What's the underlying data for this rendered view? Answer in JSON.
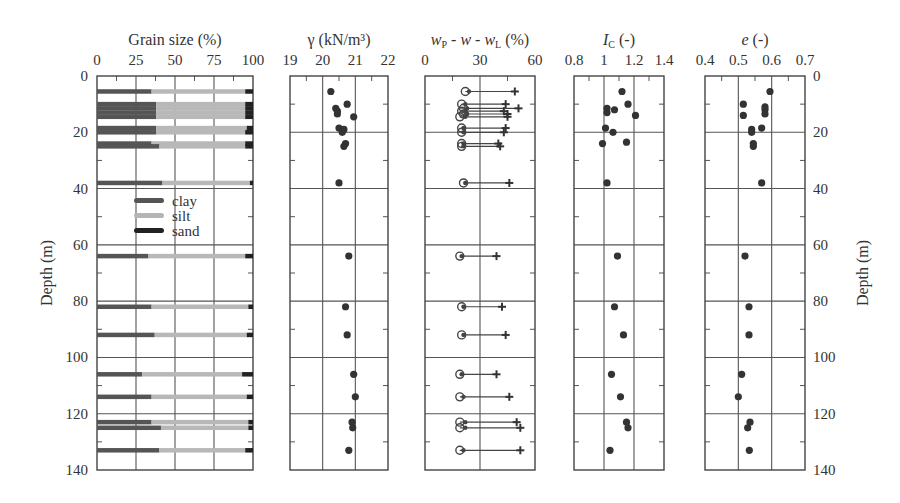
{
  "chart_data": [
    {
      "type": "bar",
      "id": "grain",
      "title": "Grain size (%)",
      "xlim": [
        0,
        100
      ],
      "xticks": [
        0,
        25,
        50,
        75,
        100
      ],
      "ylabel": "Depth (m)",
      "ylim": [
        0,
        140
      ],
      "yticks": [
        0,
        20,
        40,
        60,
        80,
        100,
        120,
        140
      ],
      "legend": [
        {
          "label": "clay",
          "color": "#555555"
        },
        {
          "label": "silt",
          "color": "#b5b5b5"
        },
        {
          "label": "sand",
          "color": "#222222"
        }
      ],
      "stacked_rows": [
        {
          "depth": 5.5,
          "clay": 35,
          "silt": 60,
          "sand": 5
        },
        {
          "depth": 10,
          "clay": 38,
          "silt": 57,
          "sand": 5
        },
        {
          "depth": 11.5,
          "clay": 38,
          "silt": 57,
          "sand": 5
        },
        {
          "depth": 13,
          "clay": 38,
          "silt": 57,
          "sand": 5
        },
        {
          "depth": 14.5,
          "clay": 38,
          "silt": 57,
          "sand": 5
        },
        {
          "depth": 18.5,
          "clay": 38,
          "silt": 58,
          "sand": 4
        },
        {
          "depth": 20,
          "clay": 38,
          "silt": 57,
          "sand": 5
        },
        {
          "depth": 24,
          "clay": 35,
          "silt": 60,
          "sand": 5
        },
        {
          "depth": 25,
          "clay": 40,
          "silt": 55,
          "sand": 5
        },
        {
          "depth": 38,
          "clay": 42,
          "silt": 56,
          "sand": 2
        },
        {
          "depth": 64,
          "clay": 33,
          "silt": 62,
          "sand": 5
        },
        {
          "depth": 82,
          "clay": 35,
          "silt": 62,
          "sand": 3
        },
        {
          "depth": 92,
          "clay": 37,
          "silt": 59,
          "sand": 4
        },
        {
          "depth": 106,
          "clay": 29,
          "silt": 64,
          "sand": 7
        },
        {
          "depth": 114,
          "clay": 35,
          "silt": 61,
          "sand": 4
        },
        {
          "depth": 123,
          "clay": 35,
          "silt": 62,
          "sand": 3
        },
        {
          "depth": 125,
          "clay": 41,
          "silt": 56,
          "sand": 3
        },
        {
          "depth": 133,
          "clay": 40,
          "silt": 55,
          "sand": 5
        }
      ]
    },
    {
      "type": "scatter",
      "id": "gamma",
      "title": "γ (kN/m³)",
      "xlim": [
        19,
        22
      ],
      "xticks": [
        19,
        20,
        21,
        22
      ],
      "ylim": [
        0,
        140
      ],
      "points": [
        {
          "x": 20.25,
          "depth": 5.5
        },
        {
          "x": 20.75,
          "depth": 10
        },
        {
          "x": 20.4,
          "depth": 11.5
        },
        {
          "x": 20.45,
          "depth": 12.5
        },
        {
          "x": 20.45,
          "depth": 13.5
        },
        {
          "x": 20.95,
          "depth": 14.5
        },
        {
          "x": 20.5,
          "depth": 18.5
        },
        {
          "x": 20.65,
          "depth": 19
        },
        {
          "x": 20.6,
          "depth": 20
        },
        {
          "x": 20.7,
          "depth": 24
        },
        {
          "x": 20.65,
          "depth": 25
        },
        {
          "x": 20.5,
          "depth": 38
        },
        {
          "x": 20.8,
          "depth": 64
        },
        {
          "x": 20.7,
          "depth": 82
        },
        {
          "x": 20.75,
          "depth": 92
        },
        {
          "x": 20.95,
          "depth": 106
        },
        {
          "x": 21.0,
          "depth": 114
        },
        {
          "x": 20.9,
          "depth": 123
        },
        {
          "x": 20.92,
          "depth": 125
        },
        {
          "x": 20.8,
          "depth": 133
        }
      ]
    },
    {
      "type": "range",
      "id": "atterberg",
      "title": "wP - w - wL (%)",
      "xlim": [
        0,
        60
      ],
      "xticks": [
        0,
        30,
        60
      ],
      "ylim": [
        0,
        140
      ],
      "rows": [
        {
          "depth": 5.5,
          "wP": 22,
          "w": 24,
          "wL": 49
        },
        {
          "depth": 10,
          "wP": 20,
          "w": 22,
          "wL": 44
        },
        {
          "depth": 11.5,
          "wP": 21,
          "w": 23,
          "wL": 51
        },
        {
          "depth": 12.5,
          "wP": 20,
          "w": 22,
          "wL": 43
        },
        {
          "depth": 13.5,
          "wP": 21,
          "w": 23,
          "wL": 45
        },
        {
          "depth": 14.5,
          "wP": 19,
          "w": 22,
          "wL": 45
        },
        {
          "depth": 18.5,
          "wP": 20,
          "w": 21,
          "wL": 44
        },
        {
          "depth": 20,
          "wP": 20,
          "w": 21,
          "wL": 43
        },
        {
          "depth": 24,
          "wP": 20,
          "w": 21,
          "wL": 40
        },
        {
          "depth": 25,
          "wP": 20,
          "w": 21,
          "wL": 41
        },
        {
          "depth": 38,
          "wP": 21,
          "w": 22,
          "wL": 46
        },
        {
          "depth": 64,
          "wP": 19,
          "w": 20,
          "wL": 39
        },
        {
          "depth": 82,
          "wP": 20,
          "w": 21,
          "wL": 42
        },
        {
          "depth": 92,
          "wP": 20,
          "w": 21,
          "wL": 44
        },
        {
          "depth": 106,
          "wP": 19,
          "w": 20,
          "wL": 39
        },
        {
          "depth": 114,
          "wP": 19,
          "w": 21,
          "wL": 46
        },
        {
          "depth": 123,
          "wP": 19,
          "w": 22,
          "wL": 50
        },
        {
          "depth": 125,
          "wP": 19,
          "w": 22,
          "wL": 52
        },
        {
          "depth": 133,
          "wP": 19,
          "w": 21,
          "wL": 52
        }
      ]
    },
    {
      "type": "scatter",
      "id": "ic",
      "title": "IC (-)",
      "xlim": [
        0.8,
        1.4
      ],
      "xticks": [
        0.8,
        1.0,
        1.2,
        1.4
      ],
      "ylim": [
        0,
        140
      ],
      "points": [
        {
          "x": 1.12,
          "depth": 5.5
        },
        {
          "x": 1.16,
          "depth": 10
        },
        {
          "x": 1.02,
          "depth": 11.5
        },
        {
          "x": 1.07,
          "depth": 12
        },
        {
          "x": 1.02,
          "depth": 13
        },
        {
          "x": 1.21,
          "depth": 14
        },
        {
          "x": 1.01,
          "depth": 18.5
        },
        {
          "x": 1.06,
          "depth": 20
        },
        {
          "x": 0.99,
          "depth": 24
        },
        {
          "x": 1.15,
          "depth": 23.5
        },
        {
          "x": 1.02,
          "depth": 38
        },
        {
          "x": 1.09,
          "depth": 64
        },
        {
          "x": 1.07,
          "depth": 82
        },
        {
          "x": 1.13,
          "depth": 92
        },
        {
          "x": 1.05,
          "depth": 106
        },
        {
          "x": 1.11,
          "depth": 114
        },
        {
          "x": 1.15,
          "depth": 123
        },
        {
          "x": 1.16,
          "depth": 125
        },
        {
          "x": 1.04,
          "depth": 133
        }
      ]
    },
    {
      "type": "scatter",
      "id": "e",
      "title": "e (-)",
      "xlim": [
        0.4,
        0.7
      ],
      "xticks": [
        0.4,
        0.5,
        0.6,
        0.7
      ],
      "ylabel": "Depth (m)",
      "ylim": [
        0,
        140
      ],
      "points": [
        {
          "x": 0.595,
          "depth": 5.5
        },
        {
          "x": 0.515,
          "depth": 10
        },
        {
          "x": 0.58,
          "depth": 11
        },
        {
          "x": 0.58,
          "depth": 12
        },
        {
          "x": 0.515,
          "depth": 14
        },
        {
          "x": 0.58,
          "depth": 13.5
        },
        {
          "x": 0.57,
          "depth": 18.5
        },
        {
          "x": 0.54,
          "depth": 19
        },
        {
          "x": 0.54,
          "depth": 20
        },
        {
          "x": 0.545,
          "depth": 24
        },
        {
          "x": 0.545,
          "depth": 25
        },
        {
          "x": 0.57,
          "depth": 38
        },
        {
          "x": 0.52,
          "depth": 64
        },
        {
          "x": 0.532,
          "depth": 82
        },
        {
          "x": 0.532,
          "depth": 92
        },
        {
          "x": 0.51,
          "depth": 106
        },
        {
          "x": 0.5,
          "depth": 114
        },
        {
          "x": 0.535,
          "depth": 123
        },
        {
          "x": 0.528,
          "depth": 125
        },
        {
          "x": 0.533,
          "depth": 133
        }
      ]
    }
  ],
  "labels": {
    "grain_title": "Grain size (%)",
    "gamma_title": "γ (kN/m³)",
    "atterberg_title": "wP - w - wL (%)",
    "ic_title": "IC (-)",
    "e_title": "e (-)",
    "depth_label": "Depth (m)"
  }
}
